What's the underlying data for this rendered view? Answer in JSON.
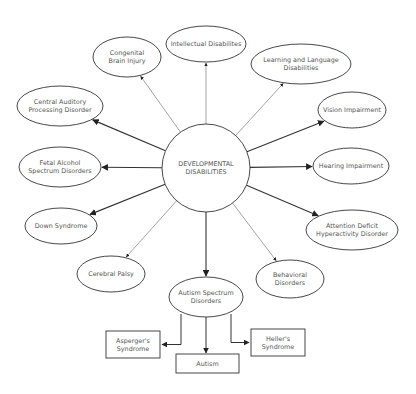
{
  "diagram": {
    "center": {
      "id": "developmental-disabilities",
      "lines": [
        "DEVELOPMENTAL",
        "DISABILITIES"
      ],
      "shape": "circle",
      "cx": 206,
      "cy": 168,
      "r": 44
    },
    "nodes": [
      {
        "id": "congenital-brain-injury",
        "lines": [
          "Congenital",
          "Brain Injury"
        ],
        "cx": 127,
        "cy": 57,
        "rx": 34,
        "ry": 20
      },
      {
        "id": "intellectual-disabilities",
        "lines": [
          "Intellectual Disabilites"
        ],
        "cx": 206,
        "cy": 44,
        "rx": 40,
        "ry": 18
      },
      {
        "id": "learning-language-disabilities",
        "lines": [
          "Learning and Language",
          "Disabilities"
        ],
        "cx": 301,
        "cy": 64,
        "rx": 50,
        "ry": 20
      },
      {
        "id": "vision-impairment",
        "lines": [
          "Vision Impairment"
        ],
        "cx": 352,
        "cy": 110,
        "rx": 34,
        "ry": 18
      },
      {
        "id": "hearing-impairment",
        "lines": [
          "Hearing Impairment"
        ],
        "cx": 351,
        "cy": 166,
        "rx": 38,
        "ry": 18
      },
      {
        "id": "adhd",
        "lines": [
          "Attention Deficit",
          "Hyperactivity Disorder"
        ],
        "cx": 352,
        "cy": 230,
        "rx": 46,
        "ry": 20
      },
      {
        "id": "behavioral-disorders",
        "lines": [
          "Behavioral",
          "Disorders"
        ],
        "cx": 290,
        "cy": 279,
        "rx": 34,
        "ry": 19
      },
      {
        "id": "autism-spectrum-disorders",
        "lines": [
          "Autism Spectrum",
          "Disorders"
        ],
        "cx": 206,
        "cy": 297,
        "rx": 37,
        "ry": 20
      },
      {
        "id": "cerebral-palsy",
        "lines": [
          "Cerebral Palsy"
        ],
        "cx": 111,
        "cy": 274,
        "rx": 34,
        "ry": 18
      },
      {
        "id": "down-syndrome",
        "lines": [
          "Down Syndrome"
        ],
        "cx": 61,
        "cy": 226,
        "rx": 36,
        "ry": 18
      },
      {
        "id": "fetal-alcohol-spectrum-disorders",
        "lines": [
          "Fetal Alcohol",
          "Spectrum Disorders"
        ],
        "cx": 60,
        "cy": 167,
        "rx": 41,
        "ry": 20
      },
      {
        "id": "central-auditory-processing-disorder",
        "lines": [
          "Central Auditory",
          "Processing Disorder"
        ],
        "cx": 60,
        "cy": 106,
        "rx": 43,
        "ry": 20
      }
    ],
    "sub_nodes": [
      {
        "id": "aspergers-syndrome",
        "lines": [
          "Asperger's",
          "Syndrome"
        ],
        "x": 106,
        "y": 331,
        "w": 54,
        "h": 27
      },
      {
        "id": "autism",
        "lines": [
          "Autism"
        ],
        "x": 176,
        "y": 354,
        "w": 63,
        "h": 19
      },
      {
        "id": "hellers-syndrome",
        "lines": [
          "Heller's",
          "Syndrome"
        ],
        "x": 251,
        "y": 329,
        "w": 54,
        "h": 27
      }
    ],
    "edges": [
      {
        "from": "developmental-disabilities",
        "to": "congenital-brain-injury",
        "weight": "thin"
      },
      {
        "from": "developmental-disabilities",
        "to": "intellectual-disabilities",
        "weight": "thin"
      },
      {
        "from": "developmental-disabilities",
        "to": "learning-language-disabilities",
        "weight": "thin"
      },
      {
        "from": "developmental-disabilities",
        "to": "vision-impairment",
        "weight": "bold"
      },
      {
        "from": "developmental-disabilities",
        "to": "hearing-impairment",
        "weight": "bold"
      },
      {
        "from": "developmental-disabilities",
        "to": "adhd",
        "weight": "bold"
      },
      {
        "from": "developmental-disabilities",
        "to": "behavioral-disorders",
        "weight": "thin"
      },
      {
        "from": "developmental-disabilities",
        "to": "autism-spectrum-disorders",
        "weight": "bold"
      },
      {
        "from": "developmental-disabilities",
        "to": "cerebral-palsy",
        "weight": "thin"
      },
      {
        "from": "developmental-disabilities",
        "to": "down-syndrome",
        "weight": "bold"
      },
      {
        "from": "developmental-disabilities",
        "to": "fetal-alcohol-spectrum-disorders",
        "weight": "bold"
      },
      {
        "from": "developmental-disabilities",
        "to": "central-auditory-processing-disorder",
        "weight": "bold"
      },
      {
        "from": "autism-spectrum-disorders",
        "to": "aspergers-syndrome",
        "weight": "bold"
      },
      {
        "from": "autism-spectrum-disorders",
        "to": "autism",
        "weight": "bold"
      },
      {
        "from": "autism-spectrum-disorders",
        "to": "hellers-syndrome",
        "weight": "bold"
      }
    ],
    "colors": {
      "stroke": "#333333",
      "thin_stroke": "#666666",
      "text": "#555555",
      "background": "#ffffff"
    }
  }
}
